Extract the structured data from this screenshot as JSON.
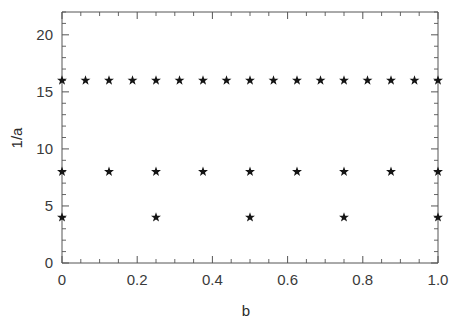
{
  "chart_data": {
    "type": "scatter",
    "title": "",
    "xlabel": "b",
    "ylabel": "1/a",
    "xlim": [
      0,
      1.0
    ],
    "ylim": [
      0,
      22
    ],
    "grid": false,
    "legend": null,
    "marker": "star",
    "marker_color": "#141414",
    "x_ticks": [
      0,
      0.2,
      0.4,
      0.6,
      0.8,
      1.0
    ],
    "x_tick_labels": [
      "0",
      "0.2",
      "0.4",
      "0.6",
      "0.8",
      "1.0"
    ],
    "x_minor_step": 0.05,
    "y_ticks": [
      0,
      5,
      10,
      15,
      20
    ],
    "y_tick_labels": [
      "0",
      "5",
      "10",
      "15",
      "20"
    ],
    "y_minor_step": 1,
    "series": [
      {
        "name": "denominator-16",
        "y_value": 16,
        "x": [
          0,
          0.0625,
          0.125,
          0.1875,
          0.25,
          0.3125,
          0.375,
          0.4375,
          0.5,
          0.5625,
          0.625,
          0.6875,
          0.75,
          0.8125,
          0.875,
          0.9375,
          1.0
        ],
        "y": [
          16,
          16,
          16,
          16,
          16,
          16,
          16,
          16,
          16,
          16,
          16,
          16,
          16,
          16,
          16,
          16,
          16
        ]
      },
      {
        "name": "denominator-8",
        "y_value": 8,
        "x": [
          0,
          0.125,
          0.25,
          0.375,
          0.5,
          0.625,
          0.75,
          0.875,
          1.0
        ],
        "y": [
          8,
          8,
          8,
          8,
          8,
          8,
          8,
          8,
          8
        ]
      },
      {
        "name": "denominator-4",
        "y_value": 4,
        "x": [
          0,
          0.25,
          0.5,
          0.75,
          1.0
        ],
        "y": [
          4,
          4,
          4,
          4,
          4
        ]
      }
    ]
  },
  "axes": {
    "x_title": "b",
    "y_title": "1/a"
  },
  "colors": {
    "marker": "#141414",
    "axis": "#555555",
    "text": "#2b2b2b",
    "background": "#ffffff"
  }
}
